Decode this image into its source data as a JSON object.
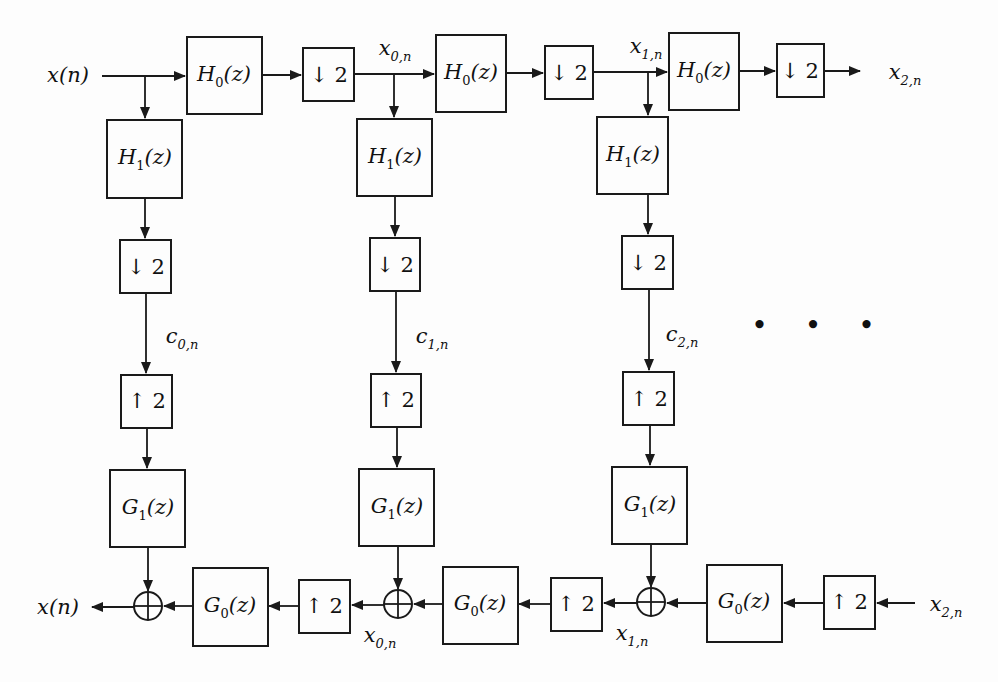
{
  "diagram": {
    "signals": {
      "input": "x(n)",
      "output": "x(n)",
      "x0n": "x",
      "x0n_sub": "0,n",
      "x1n": "x",
      "x1n_sub": "1,n",
      "x2n": "x",
      "x2n_sub": "2,n",
      "c0n": "c",
      "c0n_sub": "0,n",
      "c1n": "c",
      "c1n_sub": "1,n",
      "c2n": "c",
      "c2n_sub": "2,n"
    },
    "blocks": {
      "H0": {
        "name": "H",
        "sub": "0",
        "arg": "(z)"
      },
      "H1": {
        "name": "H",
        "sub": "1",
        "arg": "(z)"
      },
      "G0": {
        "name": "G",
        "sub": "0",
        "arg": "(z)"
      },
      "G1": {
        "name": "G",
        "sub": "1",
        "arg": "(z)"
      },
      "down": "↓ 2",
      "up": "↑ 2"
    },
    "continuation": "• • •",
    "stages": 3,
    "colors": {
      "line": "#1a1a1a",
      "background": "#fdfdfd"
    }
  }
}
